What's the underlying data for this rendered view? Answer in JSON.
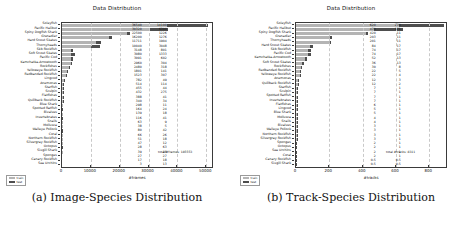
{
  "figure": {
    "panels": [
      {
        "key": "images",
        "caption": "(a) Image-Species Distribution",
        "total_note": "total #frames: 185553"
      },
      {
        "key": "tracks",
        "caption": "(b) Track-Species Distribution",
        "total_note": "total #tracks: 8311"
      }
    ]
  },
  "colors": {
    "train": "#b4b4b4",
    "test": "#4e4e4e",
    "axis": "#3a3a3a",
    "grid": "#c9c9c9",
    "background": "#ffffff"
  },
  "legend": {
    "position": "lower-left",
    "entries": [
      {
        "label": "train",
        "color": "#b4b4b4"
      },
      {
        "label": "test",
        "color": "#4e4e4e"
      }
    ]
  },
  "chart_data": [
    {
      "type": "bar",
      "orientation": "horizontal",
      "stacked": true,
      "title": "Data Distribution",
      "xlabel": "#frames",
      "ylabel": "",
      "xlim": [
        0,
        52000
      ],
      "xticks": [
        0,
        10000,
        20000,
        30000,
        40000,
        50000
      ],
      "xticklabels": [
        "0",
        "10000",
        "20000",
        "30000",
        "40000",
        "50000"
      ],
      "grid": true,
      "legend_position": "lower left",
      "categories": [
        "Soleyfish",
        "Pacific Halibut",
        "Spiny Dogfish Shark",
        "Grenadier",
        "Hard Snout Skates",
        "Thornyheads",
        "Skb Rockfish",
        "Soft Snout Skates",
        "Pacific Cod",
        "Kamchatka-Arrowtooth",
        "Rockfishes",
        "Yelloweye Rockfish",
        "Redbanded Rockfish",
        "Lingcod",
        "Anemones",
        "Starfish",
        "Sculpin",
        "Flatfishes",
        "Quillback Rockfish",
        "Blue Shark",
        "Spotted Ratfish",
        "Bivalves",
        "Invertebrates",
        "Snails",
        "Mollusca",
        "Walleye Pollock",
        "Coral",
        "Northern Rockfish",
        "Silvergray Rockfish",
        "Octopus",
        "Sixgill Shark",
        "Sponges",
        "Canary Rockfish",
        "Sea Urchins"
      ],
      "series": [
        {
          "name": "train",
          "values": [
            36540,
            30320,
            22500,
            16200,
            11711,
            10040,
            3148,
            3080,
            3091,
            2960,
            2480,
            1801,
            1523,
            782,
            514,
            455,
            432,
            388,
            340,
            298,
            164,
            139,
            116,
            63,
            38,
            80,
            66,
            51,
            47,
            28,
            39,
            27,
            17,
            3
          ]
        },
        {
          "name": "test",
          "values": [
            14100,
            6300,
            1226,
            1276,
            1904,
            3048,
            801,
            1333,
            602,
            304,
            318,
            141,
            307,
            49,
            114,
            44,
            275,
            41,
            34,
            11,
            24,
            18,
            41,
            9,
            5,
            42,
            26,
            18,
            12,
            63,
            18,
            27,
            18,
            13
          ]
        }
      ],
      "value_labels": {
        "train_column": [
          "36540",
          "30320",
          "22500",
          "16200",
          "11711",
          "10040",
          "3148",
          "3080",
          "3091",
          "2960",
          "2480",
          "1801",
          "1523",
          "782",
          "514",
          "455",
          "432",
          "388",
          "340",
          "298",
          "164",
          "139",
          "116",
          "63",
          "38",
          "80",
          "66",
          "51",
          "47",
          "28",
          "39",
          "27",
          "17",
          "3"
        ],
        "test_column": [
          "14100",
          "6300",
          "1226",
          "1276",
          "1904",
          "3048",
          "801",
          "1333",
          "602",
          "304",
          "318",
          "141",
          "307",
          "49",
          "114",
          "44",
          "275",
          "41",
          "34",
          "11",
          "24",
          "18",
          "41",
          "9",
          "5",
          "42",
          "26",
          "18",
          "12",
          "63",
          "18",
          "27",
          "18",
          "13"
        ]
      }
    },
    {
      "type": "bar",
      "orientation": "horizontal",
      "stacked": true,
      "title": "Data Distribution",
      "xlabel": "#tracks",
      "ylabel": "",
      "xlim": [
        0,
        900
      ],
      "xticks": [
        0,
        200,
        400,
        600,
        800
      ],
      "xticklabels": [
        "0",
        "200",
        "400",
        "600",
        "800"
      ],
      "grid": true,
      "legend_position": "lower left",
      "categories": [
        "Soleyfish",
        "Pacific Halibut",
        "Spiny Dogfish Shark",
        "Grenadier",
        "Thornyheads",
        "Hard Snout Skates",
        "Skb Rockfish",
        "Pacific Cod",
        "Kamchatka-Arrowtooth",
        "Soft Snout Skates",
        "Rockfishes",
        "Redbanded Rockfish",
        "Yelloweye Rockfish",
        "Anemones",
        "Quillback Rockfish",
        "Starfish",
        "Sculpin",
        "Spotted Ratfish",
        "Invertebrates",
        "Flatfishes",
        "Lingcod",
        "Blue Shark",
        "Mollusca",
        "Snails",
        "Bivalves",
        "Walleye Pollock",
        "Northern Rockfish",
        "Silvergray Rockfish",
        "Sponges",
        "Octopus",
        "Sea Urchins",
        "Coral",
        "Canary Rockfish",
        "Sixgill Shark"
      ],
      "series": [
        {
          "name": "train",
          "values": [
            620,
            470,
            420,
            203,
            201,
            84,
            74,
            74,
            52,
            36,
            30,
            22,
            22,
            12,
            12,
            7,
            7,
            7,
            7,
            6,
            5,
            5,
            4,
            4,
            3,
            3,
            3,
            3,
            2,
            2,
            2,
            2,
            0.5,
            0.5
          ]
        },
        {
          "name": "test",
          "values": [
            270,
            171,
            11,
            11,
            11,
            17,
            17,
            17,
            13,
            13,
            8,
            5,
            4,
            3,
            2,
            1,
            1,
            1,
            1,
            1,
            1,
            1,
            1,
            1,
            1,
            1,
            1,
            1,
            1,
            1,
            1,
            1,
            0.5,
            0.5
          ]
        },
        {
          "name": "labels_note",
          "values": []
        }
      ],
      "value_labels": {
        "train_column": [
          "620",
          "470",
          "420",
          "203",
          "201",
          "84",
          "74",
          "74",
          "52",
          "36",
          "30",
          "22",
          "22",
          "12",
          "12",
          "7",
          "7",
          "7",
          "7",
          "6",
          "5",
          "5",
          "4",
          "4",
          "3",
          "3",
          "3",
          "3",
          "2",
          "2",
          "2",
          "2",
          "0.5",
          "0.5"
        ],
        "test_column": [
          "270",
          "171",
          "11",
          "11",
          "11",
          "17",
          "17",
          "17",
          "13",
          "13",
          "8",
          "5",
          "4",
          "3",
          "2",
          "1",
          "1",
          "1",
          "1",
          "1",
          "1",
          "1",
          "1",
          "1",
          "1",
          "1",
          "1",
          "1",
          "1",
          "1",
          "1",
          "1",
          "0.5",
          "0.5"
        ]
      }
    }
  ]
}
